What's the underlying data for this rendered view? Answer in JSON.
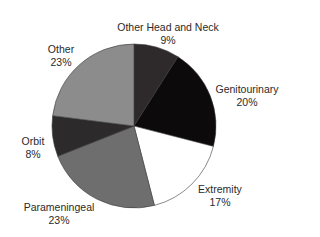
{
  "chart_data": {
    "type": "pie",
    "title": "",
    "start_angle_deg": 0,
    "direction": "clockwise",
    "categories": [
      "Other Head and Neck",
      "Genitourinary",
      "Extremity",
      "Parameningeal",
      "Orbit",
      "Other"
    ],
    "values": [
      9,
      20,
      17,
      23,
      8,
      23
    ],
    "value_labels": [
      "9%",
      "20%",
      "17%",
      "23%",
      "8%",
      "23%"
    ],
    "colors": [
      "#2e2a2b",
      "#0c0a0b",
      "#ffffff",
      "#6e6e6e",
      "#2c2a2b",
      "#8c8c8c"
    ],
    "legend": "none (direct labels)"
  },
  "labels": [
    {
      "name": "Other Head and Neck",
      "pct": "9%"
    },
    {
      "name": "Genitourinary",
      "pct": "20%"
    },
    {
      "name": "Extremity",
      "pct": "17%"
    },
    {
      "name": "Parameningeal",
      "pct": "23%"
    },
    {
      "name": "Orbit",
      "pct": "8%"
    },
    {
      "name": "Other",
      "pct": "23%"
    }
  ]
}
